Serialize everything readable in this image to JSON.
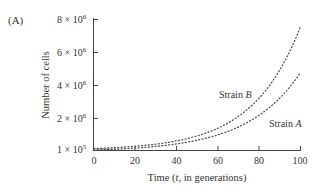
{
  "panel_label": "(A)",
  "chart_data": {
    "type": "line",
    "title": "",
    "xlabel": "Time (t, in generations)",
    "ylabel": "Number of cells",
    "xlim": [
      0,
      100
    ],
    "ylim": [
      100000,
      8000000
    ],
    "x_ticks": [
      "0",
      "20",
      "40",
      "60",
      "80",
      "100"
    ],
    "y_ticks": [
      {
        "value": 100000,
        "label": "1 × 10^5"
      },
      {
        "value": 2000000,
        "label": "2 × 10^6"
      },
      {
        "value": 4000000,
        "label": "4 × 10^6"
      },
      {
        "value": 6000000,
        "label": "6 × 10^6"
      },
      {
        "value": 8000000,
        "label": "8 × 10^6"
      }
    ],
    "grid": false,
    "legend": "inline labels",
    "series": [
      {
        "name": "Strain B",
        "style": "dotted",
        "x": [
          0,
          10,
          20,
          30,
          40,
          50,
          60,
          70,
          80,
          90,
          100
        ],
        "values": [
          100000,
          154000,
          236000,
          364000,
          560000,
          860000,
          1320000,
          2030000,
          3120000,
          4800000,
          7400000
        ]
      },
      {
        "name": "Strain A",
        "style": "dotted",
        "x": [
          0,
          10,
          20,
          30,
          40,
          50,
          60,
          70,
          80,
          90,
          100
        ],
        "values": [
          100000,
          147000,
          216000,
          318000,
          468000,
          690000,
          1010000,
          1490000,
          2190000,
          3220000,
          4740000
        ]
      }
    ],
    "annotations": [
      "Strain B",
      "Strain A"
    ]
  },
  "labels": {
    "y_tick_mantissa": [
      "8",
      "6",
      "4",
      "2",
      "1"
    ],
    "y_tick_exp": [
      "6",
      "6",
      "6",
      "6",
      "5"
    ],
    "x_ticks": [
      "0",
      "20",
      "40",
      "60",
      "80",
      "100"
    ],
    "xlabel_pre": "Time (",
    "xlabel_var": "t",
    "xlabel_post": ", in generations)",
    "ylabel": "Number of cells",
    "strain_b_pre": "Strain ",
    "strain_b_var": "B",
    "strain_a_pre": "Strain ",
    "strain_a_var": "A"
  }
}
